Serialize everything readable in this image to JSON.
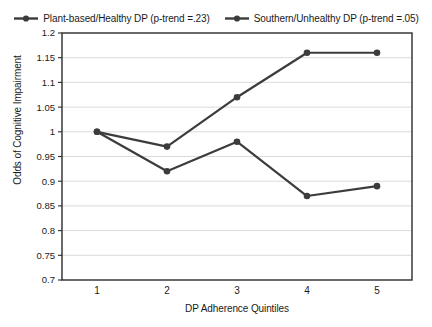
{
  "legend": {
    "position": "top",
    "entries": [
      {
        "label": "Plant-based/Healthy DP (p-trend =.23)",
        "marker": "line-dot-marker",
        "color": "#3c3c3c"
      },
      {
        "label": "Southern/Unhealthy DP (p-trend =.05)",
        "marker": "line-dot-marker",
        "color": "#3c3c3c"
      }
    ]
  },
  "axes": {
    "y_title": "Odds of Cognitive Impairment",
    "x_title": "DP Adherence Quintiles",
    "y_ticks": [
      "1.2",
      "1.15",
      "1.1",
      "1.05",
      "1",
      "0.95",
      "0.9",
      "0.85",
      "0.8",
      "0.75",
      "0.7"
    ],
    "x_ticks": [
      "1",
      "2",
      "3",
      "4",
      "5"
    ]
  },
  "colors": {
    "line": "#3c3c3c",
    "grid": "#d2d2d2",
    "border": "#2b2b2b",
    "background": "#ffffff"
  },
  "chart_data": {
    "type": "line",
    "title": "",
    "xlabel": "DP Adherence Quintiles",
    "ylabel": "Odds of Cognitive Impairment",
    "categories": [
      "1",
      "2",
      "3",
      "4",
      "5"
    ],
    "ylim": [
      0.7,
      1.2
    ],
    "ytick_step": 0.05,
    "grid": "horizontal",
    "legend_position": "top",
    "series": [
      {
        "name": "Plant-based/Healthy DP (p-trend =.23)",
        "values": [
          1.0,
          0.92,
          0.98,
          0.87,
          0.89
        ],
        "color": "#3c3c3c",
        "marker": "circle"
      },
      {
        "name": "Southern/Unhealthy DP (p-trend =.05)",
        "values": [
          1.0,
          0.97,
          1.07,
          1.16,
          1.16
        ],
        "color": "#3c3c3c",
        "marker": "circle"
      }
    ]
  }
}
